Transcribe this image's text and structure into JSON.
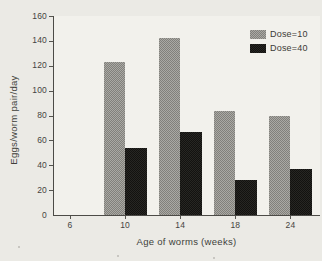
{
  "chart_data": {
    "type": "bar",
    "title": "",
    "xlabel": "Age of worms (weeks)",
    "ylabel": "Eggs/worm pair/day",
    "categories": [
      "6",
      "10",
      "14",
      "18",
      "24"
    ],
    "series": [
      {
        "name": "Dose=10",
        "style": "gray-checker",
        "values": [
          null,
          123,
          142,
          84,
          80
        ]
      },
      {
        "name": "Dose=40",
        "style": "solid-black",
        "values": [
          null,
          54,
          67,
          28,
          37
        ]
      }
    ],
    "ylim": [
      0,
      160
    ],
    "yticks": [
      0,
      20,
      40,
      60,
      80,
      100,
      120,
      140,
      160
    ],
    "grid": false,
    "legend_position": "top-right",
    "colors": {
      "dose10_dark": "#81807b",
      "dose10_light": "#aaa9a4",
      "dose40": "#1b1a18",
      "axis": "#4c4b47",
      "text": "#3c3b37",
      "background": "#ebeae5"
    }
  }
}
